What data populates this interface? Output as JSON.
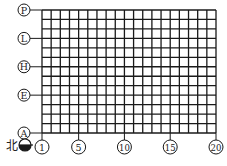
{
  "diagram": {
    "type": "axis-grid",
    "columns": {
      "first": 1,
      "last": 20,
      "labeled": [
        "1",
        "5",
        "10",
        "15",
        "20"
      ]
    },
    "rows": {
      "all": [
        "A",
        "B",
        "C",
        "D",
        "E",
        "F",
        "G",
        "H",
        "J",
        "K",
        "L",
        "M",
        "N",
        "P"
      ],
      "labeled": [
        "A",
        "E",
        "H",
        "L",
        "P"
      ]
    },
    "north_indicator": {
      "label": "北"
    },
    "colors": {
      "line": "#1a1a1a",
      "background": "#ffffff"
    }
  }
}
